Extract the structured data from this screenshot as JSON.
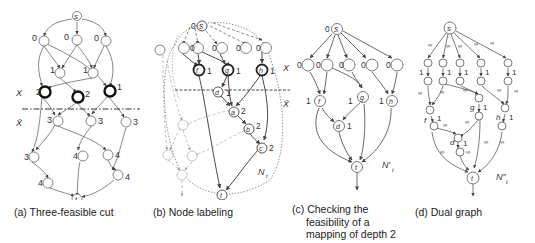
{
  "figure": {
    "panels": [
      {
        "id": "a",
        "caption": "(a) Three-feasible cut",
        "source_label": "s",
        "sink_label": "t",
        "cut_labels": {
          "above": "X",
          "below": "X̄"
        },
        "node_labels": [
          "0",
          "0",
          "0",
          "1",
          "1",
          "2",
          "2",
          "1",
          "3",
          "3",
          "3",
          "3",
          "4",
          "4",
          "4",
          "4"
        ]
      },
      {
        "id": "b",
        "caption": "(b) Node labeling",
        "source_label": "s",
        "source_value": "0",
        "sink_label": "t",
        "network_label": "N",
        "network_subscript": "t",
        "cut_labels": {
          "above": "X",
          "below": "X̄"
        },
        "named_nodes": [
          {
            "name": "f",
            "value": "1"
          },
          {
            "name": "g",
            "value": "1"
          },
          {
            "name": "h",
            "value": "1"
          },
          {
            "name": "d",
            "value": "1"
          },
          {
            "name": "a",
            "value": "2"
          },
          {
            "name": "b",
            "value": "2"
          },
          {
            "name": "c",
            "value": "2"
          }
        ],
        "top_row_values": [
          "0",
          "0",
          "0",
          "0",
          "0"
        ]
      },
      {
        "id": "c",
        "caption_lines": [
          "(c) Checking the",
          "feasibility of a",
          "mapping of depth 2"
        ],
        "source_label": "s",
        "source_value": "0",
        "sink_label": "t",
        "network_label": "N′",
        "network_subscript": "t",
        "top_row_values": [
          "0",
          "0",
          "0",
          "0",
          "0"
        ],
        "named_nodes": [
          {
            "name": "f",
            "value": "1"
          },
          {
            "name": "g",
            "value": "1"
          },
          {
            "name": "h",
            "value": "1"
          },
          {
            "name": "d",
            "value": "1"
          }
        ]
      },
      {
        "id": "d",
        "caption": "(d) Dual graph",
        "source_label": "s",
        "sink_label": "t",
        "network_label": "N″",
        "network_subscript": "t",
        "infinity": "∞",
        "unit_capacity": "1",
        "named_nodes": [
          "f",
          "g",
          "h",
          "d"
        ]
      }
    ]
  }
}
